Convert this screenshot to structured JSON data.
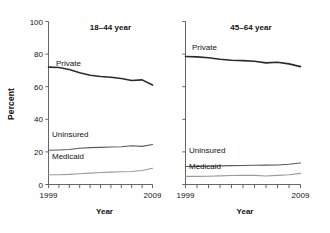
{
  "figure": {
    "y_axis_title": "Percent",
    "x_axis_title_left": "Year",
    "x_axis_title_right": "Year"
  },
  "chart_data": [
    {
      "type": "line",
      "title": "18–44 year",
      "xlabel": "Year",
      "ylabel": "Percent",
      "xlim": [
        1999,
        2009
      ],
      "ylim": [
        0,
        100
      ],
      "yticks": [
        0,
        20,
        40,
        60,
        80,
        100
      ],
      "ytick_labels": [
        "0",
        "20",
        "40",
        "60",
        "80",
        "100"
      ],
      "xticks": [
        1999,
        2000,
        2001,
        2002,
        2003,
        2004,
        2005,
        2006,
        2007,
        2008,
        2009
      ],
      "xtick_labels": [
        "1999",
        "",
        "",
        "",
        "",
        "",
        "",
        "",
        "",
        "",
        "2009"
      ],
      "grid": false,
      "legend": "inline-labels",
      "x": [
        1999,
        2000,
        2001,
        2002,
        2003,
        2004,
        2005,
        2006,
        2007,
        2008,
        2009
      ],
      "series": [
        {
          "name": "Private",
          "label": "Private",
          "color": "#2b2b2b",
          "width": 1.6,
          "values": [
            72.0,
            71.8,
            70.5,
            68.5,
            67.0,
            66.3,
            65.8,
            65.0,
            63.8,
            64.2,
            61.0
          ]
        },
        {
          "name": "Uninsured",
          "label": "Uninsured",
          "color": "#595959",
          "width": 1.1,
          "values": [
            21.0,
            21.2,
            21.5,
            22.2,
            22.6,
            22.8,
            23.0,
            23.2,
            23.8,
            23.4,
            24.5
          ]
        },
        {
          "name": "Medicaid",
          "label": "Medicaid",
          "color": "#9a9a9a",
          "width": 1.1,
          "values": [
            6.0,
            6.0,
            6.2,
            6.6,
            7.0,
            7.4,
            7.6,
            7.8,
            8.0,
            8.6,
            10.0
          ]
        }
      ]
    },
    {
      "type": "line",
      "title": "45–64 year",
      "xlabel": "Year",
      "ylabel": "",
      "xlim": [
        1999,
        2009
      ],
      "ylim": [
        0,
        100
      ],
      "yticks": [
        0,
        20,
        40,
        60,
        80,
        100
      ],
      "ytick_labels": [
        "",
        "",
        "",
        "",
        "",
        ""
      ],
      "xticks": [
        1999,
        2000,
        2001,
        2002,
        2003,
        2004,
        2005,
        2006,
        2007,
        2008,
        2009
      ],
      "xtick_labels": [
        "1999",
        "",
        "",
        "",
        "",
        "",
        "",
        "",
        "",
        "",
        "2009"
      ],
      "grid": false,
      "legend": "inline-labels",
      "x": [
        1999,
        2000,
        2001,
        2002,
        2003,
        2004,
        2005,
        2006,
        2007,
        2008,
        2009
      ],
      "series": [
        {
          "name": "Private",
          "label": "Private",
          "color": "#2b2b2b",
          "width": 1.6,
          "values": [
            78.5,
            78.3,
            77.8,
            76.8,
            76.2,
            76.0,
            75.6,
            74.6,
            75.0,
            74.0,
            72.3
          ]
        },
        {
          "name": "Uninsured",
          "label": "Uninsured",
          "color": "#595959",
          "width": 1.1,
          "values": [
            11.0,
            11.1,
            11.2,
            11.4,
            11.6,
            11.7,
            11.8,
            11.9,
            12.0,
            12.4,
            13.2
          ]
        },
        {
          "name": "Medicaid",
          "label": "Medicaid",
          "color": "#9a9a9a",
          "width": 1.1,
          "values": [
            5.0,
            5.0,
            5.1,
            5.3,
            5.5,
            5.6,
            5.6,
            5.2,
            5.6,
            6.0,
            6.8
          ]
        }
      ]
    }
  ]
}
